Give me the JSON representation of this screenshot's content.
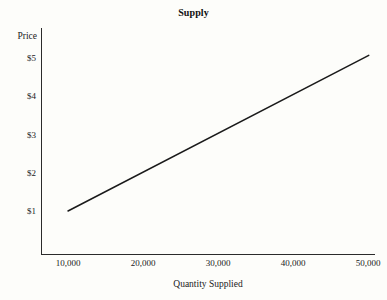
{
  "chart_data": {
    "type": "line",
    "title": "Supply",
    "xlabel": "Quantity Supplied",
    "ylabel": "Price",
    "grid": false,
    "legend": false,
    "series": [
      {
        "name": "Supply",
        "color": "#1a1a1a",
        "x": [
          10000,
          20000,
          30000,
          40000,
          50000
        ],
        "y": [
          1.0,
          2.0,
          3.0,
          4.0,
          5.0
        ]
      }
    ],
    "x_ticks": [
      {
        "value": 10000,
        "label": "10,000"
      },
      {
        "value": 20000,
        "label": "20,000"
      },
      {
        "value": 30000,
        "label": "30,000"
      },
      {
        "value": 40000,
        "label": "40,000"
      },
      {
        "value": 50000,
        "label": "50,000"
      }
    ],
    "y_ticks": [
      {
        "value": 1,
        "label": "$1"
      },
      {
        "value": 2,
        "label": "$2"
      },
      {
        "value": 3,
        "label": "$3"
      },
      {
        "value": 4,
        "label": "$4"
      },
      {
        "value": 5,
        "label": "$5"
      }
    ],
    "xlim": [
      6000,
      51500
    ],
    "ylim": [
      0.1,
      5.9
    ],
    "line_endpoints": {
      "x_start": 10000,
      "y_start": 1.0,
      "x_end": 50100,
      "y_end": 5.07
    },
    "colors": {
      "axis": "#2b2b2b",
      "line": "#1a1a1a",
      "background": "#fdfdfa",
      "text": "#1a1a1a"
    }
  }
}
